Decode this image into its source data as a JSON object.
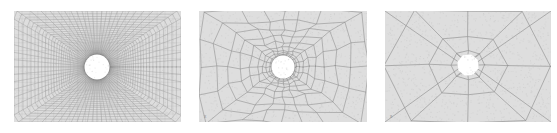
{
  "figure": {
    "background_color": "#ffffff",
    "width": 557,
    "height": 133,
    "caption": "",
    "panel_count": 3
  },
  "palette": {
    "page_background": "#ffffff",
    "plate_fill": "#dedede",
    "mesh_line_fine": "#8d8d8d",
    "mesh_line_medium": "#8a8a8a",
    "mesh_line_coarse": "#909090",
    "hole_fill": "#ffffff",
    "border_color": "#b6b6b6",
    "grain_color": "#bdbdbd"
  },
  "panels": [
    {
      "id": "panel-fine",
      "label": "",
      "refinement_level": "fine",
      "position": {
        "x": 14,
        "y": 11,
        "width": 167,
        "height": 111
      },
      "plate": {
        "width": 167,
        "height": 111
      },
      "hole": {
        "cx": 83,
        "cy": 56,
        "r": 12.5,
        "shape": "circle"
      },
      "mesh": {
        "type": "structured-quadrilateral-radial",
        "radial_divisions": 46,
        "circumferential_divisions": 72,
        "outer_rings": 17,
        "line_width": 0.35,
        "element_count_estimate": 3312
      },
      "marker": {
        "visible": false,
        "text": ""
      }
    },
    {
      "id": "panel-medium",
      "label": "",
      "refinement_level": "medium",
      "position": {
        "x": 199,
        "y": 11,
        "width": 168,
        "height": 111
      },
      "plate": {
        "width": 168,
        "height": 111
      },
      "hole": {
        "cx": 84,
        "cy": 56,
        "r": 11.5,
        "shape": "circle"
      },
      "mesh": {
        "type": "unstructured-quadrilateral-radial",
        "radial_divisions": 11,
        "circumferential_divisions": 20,
        "outer_rings": 4,
        "line_width": 0.55,
        "element_count_estimate": 220
      },
      "marker": {
        "visible": true,
        "text": "x"
      }
    },
    {
      "id": "panel-coarse",
      "label": "",
      "refinement_level": "coarse",
      "position": {
        "x": 385,
        "y": 11,
        "width": 166,
        "height": 111
      },
      "plate": {
        "width": 166,
        "height": 111
      },
      "hole": {
        "cx": 83,
        "cy": 54,
        "r": 11,
        "shape": "polygon"
      },
      "mesh": {
        "type": "coarse-quadrilateral-diagonal",
        "radial_divisions": 3,
        "circumferential_divisions": 8,
        "outer_rings": 1,
        "line_width": 0.65,
        "element_count_estimate": 24
      },
      "marker": {
        "visible": true,
        "text": "x"
      }
    }
  ]
}
